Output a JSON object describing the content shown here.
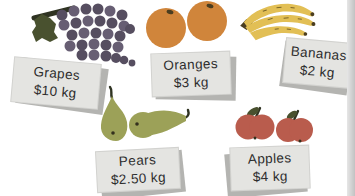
{
  "items": [
    {
      "name": "Grapes",
      "price": "$10 kg"
    },
    {
      "name": "Oranges",
      "price": "$3 kg"
    },
    {
      "name": "Bananas",
      "price": "$2 kg"
    },
    {
      "name": "Pears",
      "price": "$2.50 kg"
    },
    {
      "name": "Apples",
      "price": "$4 kg"
    }
  ],
  "colors": {
    "bg": "#ffffff",
    "ink": "#2d2d2d",
    "card": "#e4e4e1",
    "cardShadow": "#b4b4b1",
    "grape": "#564e60",
    "grapeLight": "#675e73",
    "leaf": "#49512f",
    "stem": "#2f3322",
    "orange": "#d0853b",
    "banana": "#e2bf55",
    "bananaSpeck": "#7a6428",
    "pear": "#9ca158",
    "apple": "#b95c4d",
    "fruitDark": "#4a3d20",
    "edge1": "#e6e6e6",
    "edge2": "#c2c2c2"
  }
}
